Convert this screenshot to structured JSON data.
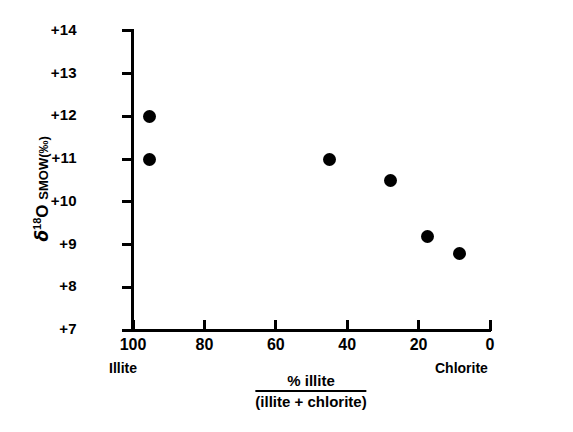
{
  "chart_data": {
    "type": "scatter",
    "title": "",
    "xlabel": "% illite / (illite + chlorite)",
    "xlabel_numerator": "% illite",
    "xlabel_denominator": "(illite + chlorite)",
    "ylabel": "δ18O SMOW (‰)",
    "ylabel_symbol": "δ",
    "ylabel_superscript": "18",
    "ylabel_rest": "O",
    "ylabel_scale": "SMOW",
    "ylabel_units": "(‰)",
    "xlim": [
      100,
      0
    ],
    "ylim": [
      7,
      14
    ],
    "x_reversed": true,
    "grid": false,
    "legend": false,
    "xticks": [
      100,
      80,
      60,
      40,
      20,
      0
    ],
    "xticklabels": [
      "100",
      "80",
      "60",
      "40",
      "20",
      "0"
    ],
    "yticks": [
      7,
      8,
      9,
      10,
      11,
      12,
      13,
      14
    ],
    "yticklabels": [
      "+7",
      "+8",
      "+9",
      "+10",
      "+11",
      "+12",
      "+13",
      "+14"
    ],
    "x_end_labels": [
      {
        "text": "Illite",
        "at": 100
      },
      {
        "text": "Chlorite",
        "at": 0
      }
    ],
    "marker": "filled-circle",
    "marker_color": "#000000",
    "points": [
      {
        "x": 95.5,
        "y": 12.0
      },
      {
        "x": 95.5,
        "y": 11.0
      },
      {
        "x": 45.0,
        "y": 11.0
      },
      {
        "x": 28.0,
        "y": 10.5
      },
      {
        "x": 17.5,
        "y": 9.2
      },
      {
        "x": 8.5,
        "y": 8.8
      }
    ]
  },
  "axis_colors": {
    "line": "#000000",
    "text": "#000000",
    "background": "#ffffff"
  }
}
